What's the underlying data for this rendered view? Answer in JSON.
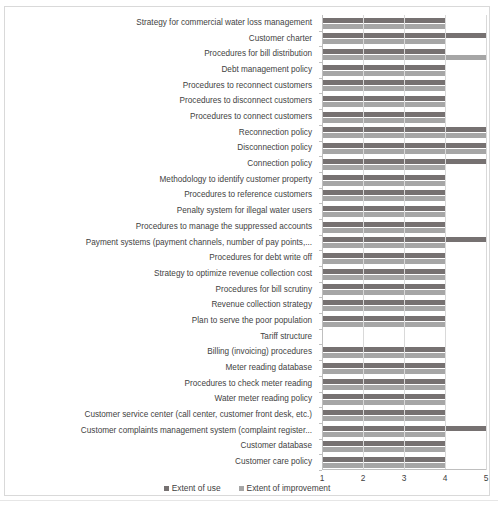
{
  "chart_data": {
    "type": "bar",
    "orientation": "horizontal",
    "title": "",
    "xlabel": "",
    "ylabel": "",
    "xlim": [
      1,
      5
    ],
    "xticks": [
      1,
      2,
      3,
      4,
      5
    ],
    "xtick_labels": [
      "1",
      "2",
      "3",
      "4",
      "5"
    ],
    "grid": true,
    "legend_position": "bottom",
    "colors": {
      "extent_of_use": "#767171",
      "extent_of_improvement": "#a6a6a6",
      "gridline": "#d9d9d9",
      "axis": "#bfbfbf",
      "text": "#3f3f3f",
      "frame": "#d9d9d9",
      "background": "#ffffff"
    },
    "categories": [
      "Strategy for commercial water loss management",
      "Customer charter",
      "Procedures for bill distribution",
      "Debt management policy",
      "Procedures to reconnect customers",
      "Procedures to disconnect customers",
      "Procedures to connect customers",
      "Reconnection policy",
      "Disconnection policy",
      "Connection policy",
      "Methodology to identify customer property",
      "Procedures to reference customers",
      "Penalty system  for illegal water users",
      "Procedures to manage the suppressed accounts",
      "Payment systems (payment channels, number of pay points,...",
      "Procedures for debt write off",
      "Strategy to optimize revenue collection cost",
      "Procedures for bill scrutiny",
      "Revenue collection strategy",
      "Plan to serve the poor population",
      "Tariff structure",
      "Billing (invoicing) procedures",
      "Meter reading database",
      "Procedures to check meter reading",
      "Water meter reading policy",
      "Customer service center (call center, customer front desk, etc.)",
      "Customer complaints management system (complaint register...",
      "Customer database",
      "Customer care policy"
    ],
    "series": [
      {
        "name": "Extent of use",
        "color": "#767171",
        "values": [
          4,
          5,
          4,
          4,
          4,
          4,
          4,
          5,
          5,
          5,
          4,
          4,
          4,
          4,
          5,
          4,
          4,
          4,
          4,
          4,
          1,
          4,
          4,
          4,
          4,
          4,
          5,
          4,
          4
        ]
      },
      {
        "name": "Extent of improvement",
        "color": "#a6a6a6",
        "values": [
          4,
          4,
          5,
          4,
          4,
          4,
          4,
          5,
          5,
          4,
          4,
          4,
          4,
          4,
          4,
          4,
          4,
          4,
          4,
          4,
          1,
          4,
          4,
          4,
          4,
          4,
          4,
          4,
          4
        ]
      }
    ]
  },
  "legend": {
    "items": [
      {
        "label": "Extent of use",
        "color": "#767171"
      },
      {
        "label": "Extent of improvement",
        "color": "#a6a6a6"
      }
    ]
  },
  "caption": {
    "text": ""
  }
}
